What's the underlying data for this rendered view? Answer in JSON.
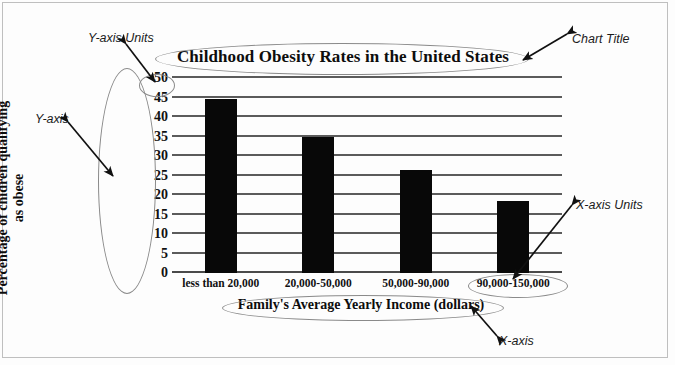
{
  "chart_data": {
    "type": "bar",
    "title": "Childhood Obesity Rates in the United States",
    "xlabel": "Family's Average Yearly Income (dollars)",
    "ylabel_line1": "Percentage of chidren qualifying",
    "ylabel_line2": "as obese",
    "categories": [
      "less than 20,000",
      "20,000-50,000",
      "50,000-90,000",
      "90,000-150,000"
    ],
    "values": [
      44.5,
      35,
      26.5,
      18.5
    ],
    "yticks": [
      0,
      5,
      10,
      15,
      20,
      25,
      30,
      35,
      40,
      45,
      50
    ],
    "ylim": [
      0,
      50
    ],
    "grid": true,
    "legend": "none",
    "bar_color": "#080808",
    "gridline_color": "#5b5b5b"
  },
  "annotations": {
    "y_axis_units": "Y-axis Units",
    "chart_title": "Chart Title",
    "y_axis": "Y-axis",
    "x_axis_units": "X-axis Units",
    "x_axis": "X-axis"
  }
}
